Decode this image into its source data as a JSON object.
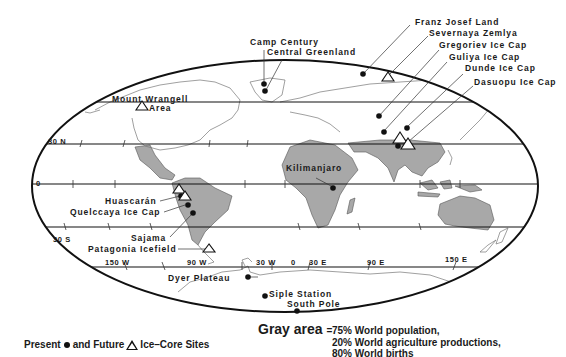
{
  "map": {
    "latitude_labels": [
      "30 N",
      "0",
      "30 S"
    ],
    "longitude_labels": [
      "150 W",
      "90 W",
      "30 W",
      "0",
      "30 E",
      "90 E",
      "150 E"
    ],
    "colors": {
      "land_highlight": "#a8a8a8",
      "outline": "#111111",
      "coast": "#666666"
    }
  },
  "sites": {
    "present": [
      "Camp Century",
      "Central Greenland",
      "Franz Josef Land",
      "Gregoriev Ice Cap",
      "Guliya Ice Cap",
      "Dunde Ice Cap",
      "Dasuopu Ice Cap",
      "Kilimanjaro",
      "Huascarán",
      "Quelccaya Ice Cap",
      "Sajama",
      "Dyer Plateau",
      "Siple Station",
      "South Pole"
    ],
    "future": [
      "Mount Wrangell Area",
      "Severnaya Zemlya",
      "Patagonia Icefield"
    ]
  },
  "labels": {
    "camp_century": "Camp Century",
    "central_greenland": "Central Greenland",
    "mount_wrangell": "Mount Wrangell",
    "mount_wrangell_area": "Area",
    "franz_josef": "Franz Josef Land",
    "severnaya": "Severnaya Zemlya",
    "gregoriev": "Gregoriev Ice Cap",
    "guliya": "Guliya Ice Cap",
    "dunde": "Dunde Ice Cap",
    "dasuopu": "Dasuopu Ice Cap",
    "kilimanjaro": "Kilimanjaro",
    "huascaran": "Huascarán",
    "quelccaya": "Quelccaya Ice Cap",
    "sajama": "Sajama",
    "patagonia": "Patagonia Icefield",
    "dyer": "Dyer Plateau",
    "siple": "Siple Station",
    "south_pole": "South Pole"
  },
  "legend": {
    "present_label": "Present",
    "and_future_label": "and Future",
    "sites_label": "Ice–Core Sites",
    "gray_title": "Gray area",
    "equals": "=",
    "gray_lines": [
      "75% World population,",
      "20% World agriculture productions,",
      "80% World births"
    ]
  }
}
